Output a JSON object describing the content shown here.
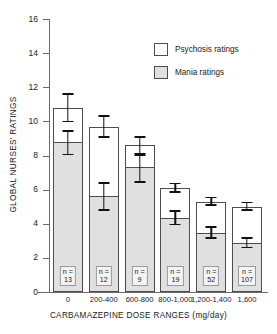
{
  "chart_data": {
    "type": "bar",
    "subtype": "stacked-bar-with-error-bars",
    "title": "",
    "xlabel": "CARBAMAZEPINE DOSE RANGES (mg/day)",
    "ylabel": "GLOBAL NURSES' RATINGS",
    "categories": [
      "0",
      "200-400",
      "600-800",
      "800-1,000",
      "1,200-1,400",
      "1,600"
    ],
    "ylim": [
      0,
      16
    ],
    "yticks": [
      0,
      2,
      4,
      6,
      8,
      10,
      12,
      14,
      16
    ],
    "ytick_labels": [
      "0",
      "2",
      "4",
      "6",
      "8",
      "10",
      "12",
      "14",
      "16"
    ],
    "grid": false,
    "legend_position": "upper right",
    "series": [
      {
        "name": "Psychosis ratings",
        "color": "#ffffff",
        "note": "total bar height (psychosis + mania stacked)",
        "values": [
          10.8,
          9.7,
          8.6,
          6.1,
          5.3,
          5.0
        ],
        "err_low": [
          10.0,
          9.1,
          8.0,
          5.85,
          5.1,
          4.8
        ],
        "err_high": [
          11.6,
          10.3,
          9.1,
          6.35,
          5.55,
          5.25
        ]
      },
      {
        "name": "Mania ratings",
        "color": "#e0e0e0",
        "note": "lower (shaded) segment of each stacked bar",
        "values": [
          8.8,
          5.6,
          7.3,
          4.35,
          3.45,
          2.85
        ],
        "err_low": [
          8.05,
          4.8,
          6.45,
          3.95,
          3.15,
          2.6
        ],
        "err_high": [
          9.45,
          6.4,
          8.1,
          4.75,
          3.8,
          3.15
        ]
      }
    ],
    "point_labels": {
      "prefix": "n =",
      "values": [
        "13",
        "12",
        "9",
        "19",
        "52",
        "107"
      ]
    }
  },
  "legend": {
    "items": [
      {
        "label": "Psychosis ratings",
        "swatch": "white"
      },
      {
        "label": "Mania ratings",
        "swatch": "gray"
      }
    ]
  },
  "colors": {
    "mania_fill": "#e0e0e0",
    "psychosis_fill": "#ffffff",
    "bar_outline": "#4d4d4d",
    "axis": "#6b6b6b",
    "error_bar": "#111111",
    "text": "#1a1a1a"
  }
}
